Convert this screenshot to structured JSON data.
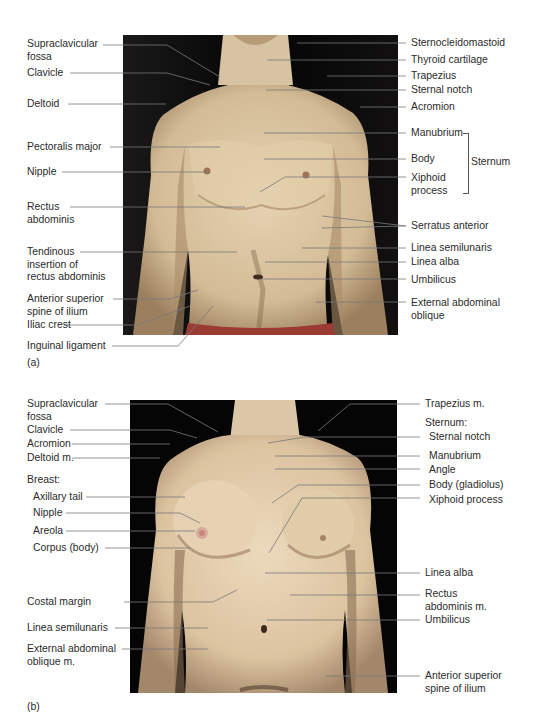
{
  "figure": {
    "panel_a": {
      "tag": "(a)",
      "left_labels": [
        {
          "text": "Supraclavicular\nfossa",
          "y": 40
        },
        {
          "text": "Clavicle",
          "y": 68
        },
        {
          "text": "Deltoid",
          "y": 98
        },
        {
          "text": "Pectoralis major",
          "y": 143
        },
        {
          "text": "Nipple",
          "y": 166
        },
        {
          "text": "Rectus\nabdominis",
          "y": 202
        },
        {
          "text": "Tendinous\ninsertion of\nrectus abdominis",
          "y": 247
        },
        {
          "text": "Anterior superior\nspine of ilium",
          "y": 292
        },
        {
          "text": "Iliac crest",
          "y": 321
        },
        {
          "text": "Inguinal ligament",
          "y": 342
        }
      ],
      "right_labels": [
        {
          "text": "Sternocleidomastoid",
          "y": 37
        },
        {
          "text": "Thyroid cartilage",
          "y": 54
        },
        {
          "text": "Trapezius",
          "y": 70
        },
        {
          "text": "Sternal notch",
          "y": 85
        },
        {
          "text": "Acromion",
          "y": 101
        },
        {
          "text": "Manubrium",
          "y": 128
        },
        {
          "text": "Body",
          "y": 154
        },
        {
          "text": "Xiphoid\nprocess",
          "y": 172
        },
        {
          "text": "Serratus anterior",
          "y": 220
        },
        {
          "text": "Linea semilunaris",
          "y": 242
        },
        {
          "text": "Linea alba",
          "y": 256
        },
        {
          "text": "Umbilicus",
          "y": 274
        },
        {
          "text": "External abdominal\noblique",
          "y": 297
        }
      ],
      "group_label": "Sternum"
    },
    "panel_b": {
      "tag": "(b)",
      "left_labels": [
        {
          "text": "Supraclavicular\nfossa",
          "x": 27,
          "y": 398
        },
        {
          "text": "Clavicle",
          "x": 27,
          "y": 425
        },
        {
          "text": "Acromion",
          "x": 27,
          "y": 439
        },
        {
          "text": "Deltoid m.",
          "x": 27,
          "y": 452
        },
        {
          "text": "Breast:",
          "x": 27,
          "y": 474
        },
        {
          "text": "Axillary tail",
          "x": 33,
          "y": 492
        },
        {
          "text": "Nipple",
          "x": 33,
          "y": 508
        },
        {
          "text": "Areola",
          "x": 33,
          "y": 526
        },
        {
          "text": "Corpus (body)",
          "x": 33,
          "y": 543
        },
        {
          "text": "Costal margin",
          "x": 27,
          "y": 596
        },
        {
          "text": "Linea semilunaris",
          "x": 27,
          "y": 622
        },
        {
          "text": "External abdominal\noblique m.",
          "x": 27,
          "y": 644
        }
      ],
      "right_labels": [
        {
          "text": "Trapezius m.",
          "x": 425,
          "y": 398
        },
        {
          "text": "Sternum:",
          "x": 425,
          "y": 418
        },
        {
          "text": "Sternal notch",
          "x": 429,
          "y": 432
        },
        {
          "text": "Manubrium",
          "x": 429,
          "y": 451
        },
        {
          "text": "Angle",
          "x": 429,
          "y": 465
        },
        {
          "text": "Body (gladiolus)",
          "x": 429,
          "y": 480
        },
        {
          "text": "Xiphoid process",
          "x": 429,
          "y": 495
        },
        {
          "text": "Linea alba",
          "x": 425,
          "y": 568
        },
        {
          "text": "Rectus\nabdominis m.",
          "x": 425,
          "y": 588
        },
        {
          "text": "Umbilicus",
          "x": 425,
          "y": 615
        },
        {
          "text": "Anterior superior\nspine of ilium",
          "x": 425,
          "y": 672
        }
      ]
    }
  },
  "colors": {
    "skin": "#d9c3a0",
    "skin_shadow": "#8a6f52",
    "background_photo": "#0a0808",
    "leader_line": "#6b6b6b",
    "shorts": "#9a3b34"
  }
}
